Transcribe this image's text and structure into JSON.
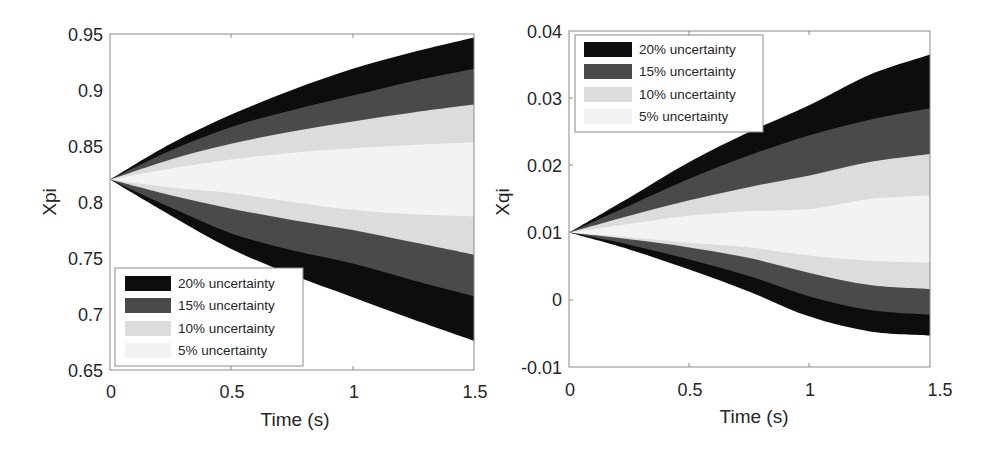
{
  "chart_data": [
    {
      "type": "area",
      "title": "",
      "xlabel": "Time (s)",
      "ylabel": "Xpi",
      "xlim": [
        0,
        1.5
      ],
      "ylim": [
        0.65,
        0.95
      ],
      "xticks": [
        "0",
        "0.5",
        "1",
        "1.5"
      ],
      "yticks": [
        "0.65",
        "0.7",
        "0.75",
        "0.8",
        "0.85",
        "0.9",
        "0.95"
      ],
      "grid": false,
      "legend_position": "lower-left",
      "x": [
        0,
        0.25,
        0.5,
        0.75,
        1.0,
        1.25,
        1.5
      ],
      "series": [
        {
          "name": "20% uncertainty",
          "color": "#0d0d0d",
          "upper": [
            0.82,
            0.852,
            0.878,
            0.9,
            0.919,
            0.934,
            0.947
          ],
          "lower": [
            0.82,
            0.788,
            0.758,
            0.735,
            0.715,
            0.695,
            0.676
          ]
        },
        {
          "name": "15% uncertainty",
          "color": "#4a4a4a",
          "upper": [
            0.82,
            0.846,
            0.867,
            0.882,
            0.895,
            0.908,
            0.919
          ],
          "lower": [
            0.82,
            0.795,
            0.772,
            0.757,
            0.745,
            0.73,
            0.716
          ]
        },
        {
          "name": "10% uncertainty",
          "color": "#dcdcdc",
          "upper": [
            0.82,
            0.838,
            0.852,
            0.863,
            0.872,
            0.88,
            0.887
          ],
          "lower": [
            0.82,
            0.806,
            0.794,
            0.784,
            0.775,
            0.764,
            0.753
          ]
        },
        {
          "name": "5% uncertainty",
          "color": "#f3f3f3",
          "upper": [
            0.82,
            0.83,
            0.838,
            0.844,
            0.848,
            0.851,
            0.853
          ],
          "lower": [
            0.82,
            0.813,
            0.808,
            0.8,
            0.793,
            0.789,
            0.787
          ]
        }
      ]
    },
    {
      "type": "area",
      "title": "",
      "xlabel": "Time (s)",
      "ylabel": "Xqi",
      "xlim": [
        0,
        1.5
      ],
      "ylim": [
        -0.01,
        0.04
      ],
      "xticks": [
        "0",
        "0.5",
        "1",
        "1.5"
      ],
      "yticks": [
        "-0.01",
        "0",
        "0.01",
        "0.02",
        "0.03",
        "0.04"
      ],
      "grid": false,
      "legend_position": "upper-left",
      "x": [
        0,
        0.25,
        0.5,
        0.75,
        1.0,
        1.25,
        1.5
      ],
      "series": [
        {
          "name": "20% uncertainty",
          "color": "#0d0d0d",
          "upper": [
            0.01,
            0.0152,
            0.0205,
            0.025,
            0.029,
            0.0335,
            0.0365
          ],
          "lower": [
            0.01,
            0.0075,
            0.0045,
            0.0012,
            -0.0025,
            -0.0047,
            -0.0053
          ]
        },
        {
          "name": "15% uncertainty",
          "color": "#4a4a4a",
          "upper": [
            0.01,
            0.014,
            0.018,
            0.0215,
            0.0245,
            0.0268,
            0.0285
          ],
          "lower": [
            0.01,
            0.0082,
            0.006,
            0.0035,
            0.0005,
            -0.0015,
            -0.0022
          ]
        },
        {
          "name": "10% uncertainty",
          "color": "#dcdcdc",
          "upper": [
            0.01,
            0.0125,
            0.0148,
            0.0168,
            0.0185,
            0.0205,
            0.0217
          ],
          "lower": [
            0.01,
            0.009,
            0.0078,
            0.0062,
            0.004,
            0.0022,
            0.0016
          ]
        },
        {
          "name": "5% uncertainty",
          "color": "#f3f3f3",
          "upper": [
            0.01,
            0.0113,
            0.0125,
            0.0132,
            0.0135,
            0.015,
            0.0155
          ],
          "lower": [
            0.01,
            0.0093,
            0.0085,
            0.0078,
            0.0066,
            0.0058,
            0.0055
          ]
        }
      ]
    }
  ],
  "charts": [
    {
      "ylabel": "Xpi",
      "xlabel": "Time (s)",
      "xticks": [
        "0",
        "0.5",
        "1",
        "1.5"
      ],
      "yticks": [
        "0.95",
        "0.9",
        "0.85",
        "0.8",
        "0.75",
        "0.7",
        "0.65"
      ],
      "legend": [
        "20% uncertainty",
        "15% uncertainty",
        "10% uncertainty",
        "5% uncertainty"
      ]
    },
    {
      "ylabel": "Xqi",
      "xlabel": "Time (s)",
      "xticks": [
        "0",
        "0.5",
        "1",
        "1.5"
      ],
      "yticks": [
        "0.04",
        "0.03",
        "0.02",
        "0.01",
        "0",
        "-0.01"
      ],
      "legend": [
        "20% uncertainty",
        "15% uncertainty",
        "10% uncertainty",
        "5% uncertainty"
      ]
    }
  ]
}
